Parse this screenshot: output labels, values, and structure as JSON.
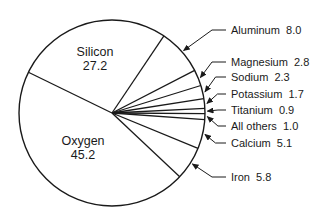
{
  "chart_data": {
    "type": "pie",
    "title": "",
    "unit": "percent",
    "start_angle_deg": 206,
    "direction": "clockwise",
    "slices": [
      {
        "label": "Silicon",
        "value": 27.2,
        "label_pos": "inside"
      },
      {
        "label": "Aluminum",
        "value": 8.0,
        "label_pos": "outside",
        "ly": 34
      },
      {
        "label": "Magnesium",
        "value": 2.8,
        "label_pos": "outside",
        "ly": 66
      },
      {
        "label": "Sodium",
        "value": 2.3,
        "label_pos": "outside",
        "ly": 81
      },
      {
        "label": "Potassium",
        "value": 1.7,
        "label_pos": "outside",
        "ly": 98
      },
      {
        "label": "Titanium",
        "value": 0.9,
        "label_pos": "outside",
        "ly": 114
      },
      {
        "label": "All others",
        "value": 1.0,
        "label_pos": "outside",
        "ly": 130
      },
      {
        "label": "Calcium",
        "value": 5.1,
        "label_pos": "outside",
        "ly": 147
      },
      {
        "label": "Iron",
        "value": 5.8,
        "label_pos": "outside",
        "ly": 181
      },
      {
        "label": "Oxygen",
        "value": 45.2,
        "label_pos": "inside"
      }
    ]
  },
  "colors": {
    "stroke": "#1a1a1a",
    "fill": "#ffffff",
    "text": "#1a1a1a"
  }
}
